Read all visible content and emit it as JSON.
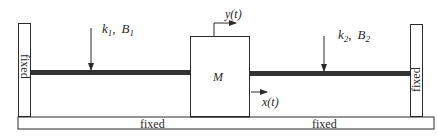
{
  "diagram": {
    "type": "mechanical-system",
    "left_wall": {
      "label": "fixed"
    },
    "right_wall": {
      "label": "fixed"
    },
    "ground": {
      "labels": [
        "fixed",
        "fixed"
      ]
    },
    "mass": {
      "label": "M"
    },
    "left_element": {
      "k": "k",
      "k_sub": "1",
      "sep": ",",
      "b": "B",
      "b_sub": "1"
    },
    "right_element": {
      "k": "k",
      "k_sub": "2",
      "sep": ",",
      "b": "B",
      "b_sub": "2"
    },
    "input_displacement": {
      "label": "y(t)"
    },
    "output_displacement": {
      "label": "x(t)"
    },
    "colors": {
      "stroke": "#2a2a2a",
      "beam": "#333333",
      "background": "#ffffff"
    }
  }
}
